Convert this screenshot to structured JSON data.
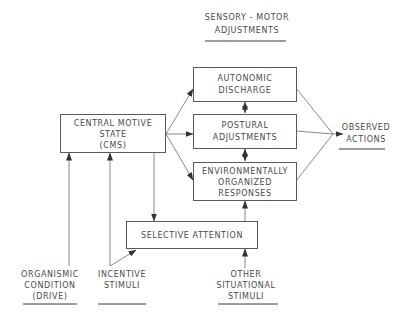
{
  "diagram": {
    "header": {
      "line1": "SENSORY - MOTOR",
      "line2": "ADJUSTMENTS"
    },
    "nodes": {
      "cms": {
        "line1": "CENTRAL MOTIVE",
        "line2": "STATE",
        "line3": "(CMS)"
      },
      "autonomic": {
        "line1": "AUTONOMIC",
        "line2": "DISCHARGE"
      },
      "postural": {
        "line1": "POSTURAL",
        "line2": "ADJUSTMENTS"
      },
      "environmental": {
        "line1": "ENVIRONMENTALLY",
        "line2": "ORGANIZED",
        "line3": "RESPONSES"
      },
      "selective_attention": {
        "line1": "SELECTIVE ATTENTION"
      }
    },
    "outputs": {
      "observed": {
        "line1": "OBSERVED",
        "line2": "ACTIONS"
      }
    },
    "inputs": {
      "organismic": {
        "line1": "ORGANISMIC",
        "line2": "CONDITION",
        "line3": "(DRIVE)"
      },
      "incentive": {
        "line1": "INCENTIVE",
        "line2": "STIMULI"
      },
      "other": {
        "line1": "OTHER",
        "line2": "SITUATIONAL",
        "line3": "STIMULI"
      }
    },
    "edges": [
      {
        "from": "organismic",
        "to": "cms"
      },
      {
        "from": "incentive",
        "to": "cms"
      },
      {
        "from": "incentive",
        "to": "selective_attention"
      },
      {
        "from": "cms",
        "to": "autonomic"
      },
      {
        "from": "cms",
        "to": "postural"
      },
      {
        "from": "cms",
        "to": "environmental"
      },
      {
        "from": "cms",
        "to": "selective_attention"
      },
      {
        "from": "selective_attention",
        "to": "environmental"
      },
      {
        "from": "other",
        "to": "selective_attention"
      },
      {
        "from": "autonomic",
        "to": "postural",
        "bidirectional": true
      },
      {
        "from": "postural",
        "to": "environmental",
        "bidirectional": true
      },
      {
        "from": "autonomic",
        "to": "observed"
      },
      {
        "from": "postural",
        "to": "observed"
      },
      {
        "from": "environmental",
        "to": "observed"
      }
    ]
  }
}
